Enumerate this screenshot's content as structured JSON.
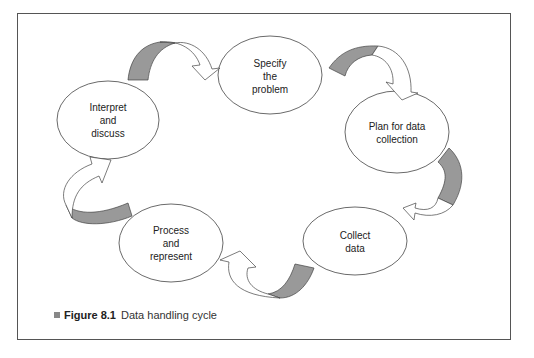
{
  "diagram": {
    "type": "cycle",
    "nodes": [
      {
        "id": "specify",
        "label_lines": [
          "Specify",
          "the",
          "problem"
        ]
      },
      {
        "id": "plan",
        "label_lines": [
          "Plan for data",
          "collection"
        ]
      },
      {
        "id": "collect",
        "label_lines": [
          "Collect",
          "data"
        ]
      },
      {
        "id": "process",
        "label_lines": [
          "Process",
          "and",
          "represent"
        ]
      },
      {
        "id": "interpret",
        "label_lines": [
          "Interpret",
          "and",
          "discuss"
        ]
      }
    ],
    "edges": [
      {
        "from": "specify",
        "to": "plan"
      },
      {
        "from": "plan",
        "to": "collect"
      },
      {
        "from": "collect",
        "to": "process"
      },
      {
        "from": "process",
        "to": "interpret"
      },
      {
        "from": "interpret",
        "to": "specify"
      }
    ],
    "colors": {
      "arrow_shade": "#999999",
      "outline": "#444444"
    }
  },
  "caption": {
    "figure_number": "Figure 8.1",
    "title": "Data handling cycle"
  }
}
